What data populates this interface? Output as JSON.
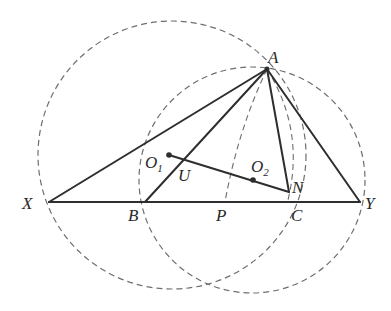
{
  "diagram": {
    "type": "geometry",
    "colors": {
      "solid": "#2e2e2e",
      "dashed": "#6e6e6e",
      "label": "#2a2a2a",
      "background": "#ffffff"
    },
    "points": {
      "A": {
        "label": "A",
        "x": 267,
        "y": 69
      },
      "X": {
        "label": "X",
        "x": 49,
        "y": 202
      },
      "B": {
        "label": "B",
        "x": 145,
        "y": 202
      },
      "P": {
        "label": "P",
        "x": 225,
        "y": 202
      },
      "C": {
        "label": "C",
        "x": 290,
        "y": 202
      },
      "Y": {
        "label": "Y",
        "x": 360,
        "y": 202
      },
      "O1": {
        "label": "O",
        "sub": "1",
        "x": 169,
        "y": 155
      },
      "O2": {
        "label": "O",
        "sub": "2",
        "x": 253,
        "y": 180
      },
      "N": {
        "label": "N",
        "x": 288,
        "y": 191
      },
      "U": {
        "label": "U",
        "x": 181,
        "y": 160
      }
    },
    "segments": [
      "XY",
      "AX",
      "AB",
      "AC",
      "AY",
      "O1N"
    ],
    "dashed_circles": [
      {
        "name": "circle-1",
        "cx": 172,
        "cy": 155,
        "r": 134
      },
      {
        "name": "circle-2",
        "cx": 252,
        "cy": 180,
        "r": 113
      }
    ],
    "dashed_arcs": [
      "A-P",
      "A-N"
    ]
  }
}
